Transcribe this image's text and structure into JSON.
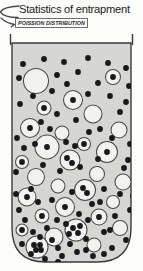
{
  "header": {
    "title": "Statistics of entrapment",
    "subtitle": "POISSION DISTRIBUTION",
    "pointer_icon": "arrow-bracket-icon"
  },
  "colors": {
    "ink": "#1b1b1b",
    "vessel_fill": "#d6d6d4",
    "vessel_stroke": "#3a3a3a",
    "bubble_fill": "#f2f2f0",
    "bubble_stroke": "#4a4a4a",
    "particle_fill": "#191919",
    "page_background": "#fdfdfc"
  },
  "diagram": {
    "name": "entrapment-vessel-diagram",
    "vessel": {
      "shape": "u-shaped-beaker",
      "left": 12,
      "right": 131,
      "top": 9,
      "bottom": 228,
      "corner_radius": 34,
      "rim_lip_height": 9
    },
    "bubbles": [
      {
        "cx": 36,
        "cy": 47,
        "r": 12.5,
        "inner": []
      },
      {
        "cx": 113,
        "cy": 43,
        "r": 7.5,
        "inner": [
          [
            113,
            43
          ]
        ]
      },
      {
        "cx": 73,
        "cy": 66,
        "r": 9.5,
        "inner": [
          [
            73,
            66
          ]
        ]
      },
      {
        "cx": 44,
        "cy": 74,
        "r": 7.0,
        "inner": [
          [
            44,
            74
          ]
        ]
      },
      {
        "cx": 93,
        "cy": 80,
        "r": 9.0,
        "inner": []
      },
      {
        "cx": 30,
        "cy": 94,
        "r": 9.5,
        "inner": [
          [
            30,
            94
          ]
        ]
      },
      {
        "cx": 62,
        "cy": 99,
        "r": 7.0,
        "inner": []
      },
      {
        "cx": 119,
        "cy": 96,
        "r": 8.0,
        "inner": []
      },
      {
        "cx": 84,
        "cy": 110,
        "r": 6.5,
        "inner": [
          [
            84,
            110
          ]
        ]
      },
      {
        "cx": 47,
        "cy": 113,
        "r": 12.0,
        "inner": [
          [
            47,
            113
          ]
        ]
      },
      {
        "cx": 107,
        "cy": 118,
        "r": 10.5,
        "inner": [
          [
            107,
            118
          ]
        ]
      },
      {
        "cx": 22,
        "cy": 128,
        "r": 6.5,
        "inner": [
          [
            22,
            128
          ]
        ]
      },
      {
        "cx": 70,
        "cy": 126,
        "r": 10.0,
        "inner": [
          [
            67,
            124
          ],
          [
            72,
            129
          ]
        ]
      },
      {
        "cx": 97,
        "cy": 140,
        "r": 7.5,
        "inner": []
      },
      {
        "cx": 36,
        "cy": 143,
        "r": 8.5,
        "inner": []
      },
      {
        "cx": 123,
        "cy": 148,
        "r": 8.0,
        "inner": []
      },
      {
        "cx": 58,
        "cy": 152,
        "r": 7.0,
        "inner": []
      },
      {
        "cx": 85,
        "cy": 156,
        "r": 10.5,
        "inner": [
          [
            83,
            154
          ],
          [
            87,
            159
          ]
        ]
      },
      {
        "cx": 27,
        "cy": 163,
        "r": 9.0,
        "inner": [
          [
            27,
            163
          ]
        ]
      },
      {
        "cx": 113,
        "cy": 168,
        "r": 6.5,
        "inner": []
      },
      {
        "cx": 65,
        "cy": 173,
        "r": 9.5,
        "inner": [
          [
            65,
            173
          ]
        ]
      },
      {
        "cx": 42,
        "cy": 182,
        "r": 7.0,
        "inner": [
          [
            42,
            182
          ]
        ]
      },
      {
        "cx": 99,
        "cy": 183,
        "r": 8.0,
        "inner": [
          [
            99,
            183
          ]
        ]
      },
      {
        "cx": 22,
        "cy": 196,
        "r": 6.0,
        "inner": [
          [
            22,
            196
          ]
        ]
      },
      {
        "cx": 76,
        "cy": 196,
        "r": 11.0,
        "inner": [
          [
            73,
            194
          ],
          [
            78,
            199
          ],
          [
            80,
            192
          ]
        ]
      },
      {
        "cx": 54,
        "cy": 203,
        "r": 9.0,
        "inner": []
      },
      {
        "cx": 120,
        "cy": 194,
        "r": 7.5,
        "inner": []
      },
      {
        "cx": 37,
        "cy": 213,
        "r": 11.0,
        "inner": [
          [
            34,
            211
          ],
          [
            40,
            211
          ],
          [
            36,
            216
          ],
          [
            41,
            216
          ]
        ]
      },
      {
        "cx": 94,
        "cy": 211,
        "r": 7.0,
        "inner": []
      }
    ],
    "particles": [
      [
        23,
        30
      ],
      [
        44,
        25
      ],
      [
        64,
        28
      ],
      [
        88,
        24
      ],
      [
        108,
        29
      ],
      [
        126,
        34
      ],
      [
        19,
        44
      ],
      [
        57,
        41
      ],
      [
        78,
        38
      ],
      [
        98,
        49
      ],
      [
        129,
        52
      ],
      [
        33,
        62
      ],
      [
        52,
        57
      ],
      [
        67,
        50
      ],
      [
        88,
        60
      ],
      [
        110,
        62
      ],
      [
        126,
        68
      ],
      [
        20,
        70
      ],
      [
        41,
        88
      ],
      [
        57,
        80
      ],
      [
        76,
        86
      ],
      [
        100,
        95
      ],
      [
        120,
        78
      ],
      [
        17,
        104
      ],
      [
        35,
        110
      ],
      [
        66,
        108
      ],
      [
        89,
        98
      ],
      [
        112,
        104
      ],
      [
        130,
        110
      ],
      [
        24,
        114
      ],
      [
        50,
        95
      ],
      [
        75,
        112
      ],
      [
        98,
        125
      ],
      [
        128,
        126
      ],
      [
        16,
        138
      ],
      [
        43,
        131
      ],
      [
        60,
        137
      ],
      [
        80,
        133
      ],
      [
        104,
        155
      ],
      [
        124,
        134
      ],
      [
        31,
        155
      ],
      [
        52,
        166
      ],
      [
        72,
        158
      ],
      [
        92,
        170
      ],
      [
        115,
        182
      ],
      [
        133,
        162
      ],
      [
        19,
        176
      ],
      [
        38,
        168
      ],
      [
        57,
        186
      ],
      [
        79,
        180
      ],
      [
        100,
        168
      ],
      [
        120,
        160
      ],
      [
        25,
        186
      ],
      [
        47,
        194
      ],
      [
        66,
        190
      ],
      [
        88,
        186
      ],
      [
        110,
        196
      ],
      [
        130,
        176
      ],
      [
        16,
        160
      ],
      [
        33,
        198
      ],
      [
        58,
        214
      ],
      [
        70,
        210
      ],
      [
        86,
        205
      ],
      [
        104,
        198
      ],
      [
        126,
        206
      ],
      [
        22,
        210
      ],
      [
        45,
        225
      ],
      [
        62,
        222
      ],
      [
        77,
        218
      ],
      [
        93,
        222
      ],
      [
        112,
        214
      ],
      [
        31,
        220
      ],
      [
        52,
        206
      ],
      [
        69,
        200
      ],
      [
        104,
        220
      ],
      [
        118,
        226
      ],
      [
        40,
        203
      ],
      [
        86,
        216
      ],
      [
        58,
        228
      ]
    ]
  }
}
